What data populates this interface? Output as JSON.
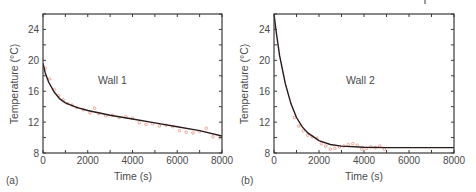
{
  "colors": {
    "frame": "#3a3a3a",
    "fit_line": "#2b1b1b",
    "measured": "#e8836b",
    "text": "#4a4a4a"
  },
  "chart_data": [
    {
      "type": "line",
      "panel_label": "(a)",
      "annotation": "Wall 1",
      "xlabel": "Time (s)",
      "ylabel": "Temperature (°C)",
      "xlim": [
        0,
        8000
      ],
      "ylim": [
        8,
        26
      ],
      "xticks": [
        0,
        2000,
        4000,
        6000,
        8000
      ],
      "yticks": [
        8,
        12,
        16,
        20,
        24
      ],
      "grid": false,
      "legend": null,
      "series": [
        {
          "name": "fit",
          "style": "solid-line",
          "x": [
            0,
            100,
            250,
            500,
            750,
            1000,
            1500,
            2000,
            3000,
            4000,
            5000,
            6000,
            7000,
            8000
          ],
          "values": [
            19.6,
            18.4,
            17.2,
            15.9,
            15.0,
            14.5,
            13.9,
            13.5,
            12.9,
            12.4,
            11.9,
            11.4,
            10.9,
            10.2
          ]
        },
        {
          "name": "measured",
          "style": "open-circles",
          "x": [
            100,
            300,
            500,
            700,
            900,
            1100,
            1300,
            1500,
            1800,
            2100,
            2300,
            2500,
            2800,
            3100,
            3400,
            3700,
            4000,
            4300,
            4600,
            4900,
            5200,
            5500,
            5800,
            6100,
            6400,
            6700,
            7000,
            7300,
            7600,
            7900
          ],
          "values": [
            19.0,
            17.6,
            16.2,
            15.4,
            14.9,
            14.4,
            14.2,
            13.9,
            13.6,
            13.2,
            13.8,
            13.1,
            12.8,
            12.9,
            12.6,
            12.7,
            12.5,
            11.9,
            11.7,
            11.8,
            11.5,
            11.6,
            11.4,
            10.9,
            10.7,
            10.6,
            10.8,
            11.2,
            10.1,
            10.0
          ]
        }
      ]
    },
    {
      "type": "line",
      "panel_label": "(b)",
      "annotation": "Wall 2",
      "xlabel": "Time (s)",
      "ylabel": "Temperature (°C)",
      "xlim": [
        0,
        8000
      ],
      "ylim": [
        8,
        26
      ],
      "xticks": [
        0,
        2000,
        4000,
        6000,
        8000
      ],
      "yticks": [
        8,
        12,
        16,
        20,
        24
      ],
      "grid": false,
      "legend": null,
      "series": [
        {
          "name": "fit",
          "style": "solid-line",
          "x": [
            0,
            100,
            250,
            500,
            750,
            1000,
            1250,
            1500,
            2000,
            2500,
            3000,
            4000,
            5000,
            6000,
            7000,
            8000
          ],
          "values": [
            26.0,
            23.6,
            20.6,
            17.0,
            14.4,
            12.6,
            11.4,
            10.6,
            9.6,
            9.1,
            8.9,
            8.75,
            8.7,
            8.7,
            8.7,
            8.7
          ]
        },
        {
          "name": "measured",
          "style": "open-circles",
          "x": [
            900,
            1100,
            1300,
            1500,
            1700,
            1900,
            2100,
            2300,
            2500,
            2700,
            2900,
            3100,
            3300,
            3500,
            3700,
            3900,
            4100,
            4300,
            4500,
            4700,
            4900
          ],
          "values": [
            12.6,
            11.5,
            10.9,
            10.3,
            10.1,
            9.9,
            9.2,
            8.9,
            8.5,
            8.6,
            8.8,
            8.9,
            9.1,
            9.2,
            9.0,
            8.5,
            8.6,
            8.8,
            8.7,
            8.9,
            8.5
          ]
        }
      ]
    }
  ],
  "panels": [
    {
      "panel_label": "(a)",
      "annotation": "Wall 1",
      "xlabel": "Time (s)",
      "ylabel": "Temperature (°C)"
    },
    {
      "panel_label": "(b)",
      "annotation": "Wall 2",
      "xlabel": "Time (s)",
      "ylabel": "Temperature (°C)"
    }
  ]
}
